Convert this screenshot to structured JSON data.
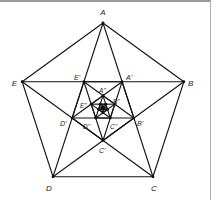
{
  "diagram": {
    "center": [
      103,
      108
    ],
    "radius": 85,
    "colors": {
      "stroke": "#111111",
      "label": "#222222",
      "frame": "#9a9a9a"
    },
    "outer_vertices": {
      "A": {
        "label": "A"
      },
      "B": {
        "label": "B"
      },
      "C": {
        "label": "C"
      },
      "D": {
        "label": "D"
      },
      "E": {
        "label": "E"
      }
    },
    "first_inner": {
      "A1": {
        "label": "A'"
      },
      "B1": {
        "label": "B'"
      },
      "C1": {
        "label": "C'"
      },
      "D1": {
        "label": "D'"
      },
      "E1": {
        "label": "E'"
      }
    },
    "second_inner": {
      "A2": {
        "label": "A''"
      },
      "B2": {
        "label": "B''"
      },
      "C2": {
        "label": "C''"
      },
      "D2": {
        "label": "D''"
      },
      "E2": {
        "label": "E''"
      }
    }
  }
}
